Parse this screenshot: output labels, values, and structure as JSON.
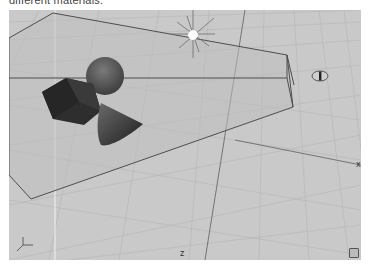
{
  "caption": {
    "text": "different materials."
  },
  "viewport": {
    "type": "3d-perspective-viewport",
    "background": "#c9c9c9",
    "grid_color": "#b4b4b4",
    "objects": [
      {
        "name": "sphere",
        "color": "#555555"
      },
      {
        "name": "cube",
        "color": "#2f2f2f"
      },
      {
        "name": "cone",
        "color": "#3c3c3c"
      },
      {
        "name": "point-light",
        "color": "#ffffff"
      },
      {
        "name": "camera-frustum",
        "color": "#555555"
      },
      {
        "name": "camera-eye"
      }
    ],
    "axis_labels": {
      "x": "x",
      "z": "z",
      "y": "y"
    }
  }
}
